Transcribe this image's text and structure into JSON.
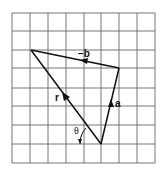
{
  "diagram": {
    "type": "vector-triangle-on-grid",
    "grid": {
      "columns": 8,
      "rows": 8,
      "x0": 12,
      "y0": 13,
      "x1": 155,
      "y1": 163,
      "line_color": "#555555"
    },
    "vertices": {
      "top_left": [
        31,
        50
      ],
      "right": [
        119,
        68
      ],
      "bottom": [
        101,
        144
      ]
    },
    "vectors": [
      {
        "name": "a",
        "label": "a",
        "from": "bottom",
        "to": "right",
        "direction": "up"
      },
      {
        "name": "neg-b",
        "label": "−b",
        "from": "right",
        "to": "top_left",
        "direction": "left"
      },
      {
        "name": "r",
        "label": "r",
        "from": "bottom",
        "to": "top_left",
        "direction": "up-left"
      }
    ],
    "angle": {
      "label": "θ",
      "between": [
        "r",
        "horizontal"
      ]
    },
    "colors": {
      "stroke": "#111111",
      "background": "#ffffff"
    }
  }
}
